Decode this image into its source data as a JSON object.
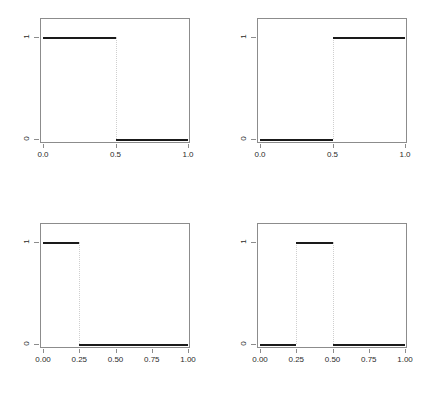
{
  "figure": {
    "layout": "2x2",
    "background_color": "#ffffff",
    "box_color": "#8c8c8c",
    "line_color": "#1a1a1a",
    "dotted_color": "#cfcfcf"
  },
  "chart_data": [
    {
      "type": "line",
      "panel": "top-left",
      "title": "",
      "xlabel": "",
      "ylabel": "",
      "xlim": [
        0.0,
        1.0
      ],
      "ylim": [
        0,
        1
      ],
      "grid": false,
      "legend": null,
      "step_style": "piecewise-constant",
      "xticks": [
        0.0,
        0.5,
        1.0
      ],
      "xtick_labels": [
        "0.0",
        "0.5",
        "1.0"
      ],
      "yticks": [
        0,
        1
      ],
      "ytick_labels": [
        "0",
        "1"
      ],
      "segments": [
        {
          "x_start": 0.0,
          "x_end": 0.5,
          "y": 1
        },
        {
          "x_start": 0.5,
          "x_end": 1.0,
          "y": 0
        }
      ],
      "jumps": [
        0.5
      ]
    },
    {
      "type": "line",
      "panel": "top-right",
      "title": "",
      "xlabel": "",
      "ylabel": "",
      "xlim": [
        0.0,
        1.0
      ],
      "ylim": [
        0,
        1
      ],
      "grid": false,
      "legend": null,
      "step_style": "piecewise-constant",
      "xticks": [
        0.0,
        0.5,
        1.0
      ],
      "xtick_labels": [
        "0.0",
        "0.5",
        "1.0"
      ],
      "yticks": [
        0,
        1
      ],
      "ytick_labels": [
        "0",
        "1"
      ],
      "segments": [
        {
          "x_start": 0.0,
          "x_end": 0.5,
          "y": 0
        },
        {
          "x_start": 0.5,
          "x_end": 1.0,
          "y": 1
        }
      ],
      "jumps": [
        0.5
      ]
    },
    {
      "type": "line",
      "panel": "bottom-left",
      "title": "",
      "xlabel": "",
      "ylabel": "",
      "xlim": [
        0.0,
        1.0
      ],
      "ylim": [
        0,
        1
      ],
      "grid": false,
      "legend": null,
      "step_style": "piecewise-constant",
      "xticks": [
        0.0,
        0.25,
        0.5,
        0.75,
        1.0
      ],
      "xtick_labels": [
        "0.00",
        "0.25",
        "0.50",
        "0.75",
        "1.00"
      ],
      "yticks": [
        0,
        1
      ],
      "ytick_labels": [
        "0",
        "1"
      ],
      "segments": [
        {
          "x_start": 0.0,
          "x_end": 0.25,
          "y": 1
        },
        {
          "x_start": 0.25,
          "x_end": 1.0,
          "y": 0
        }
      ],
      "jumps": [
        0.25
      ]
    },
    {
      "type": "line",
      "panel": "bottom-right",
      "title": "",
      "xlabel": "",
      "ylabel": "",
      "xlim": [
        0.0,
        1.0
      ],
      "ylim": [
        0,
        1
      ],
      "grid": false,
      "legend": null,
      "step_style": "piecewise-constant",
      "xticks": [
        0.0,
        0.25,
        0.5,
        0.75,
        1.0
      ],
      "xtick_labels": [
        "0.00",
        "0.25",
        "0.50",
        "0.75",
        "1.00"
      ],
      "yticks": [
        0,
        1
      ],
      "ytick_labels": [
        "0",
        "1"
      ],
      "segments": [
        {
          "x_start": 0.0,
          "x_end": 0.25,
          "y": 0
        },
        {
          "x_start": 0.25,
          "x_end": 0.5,
          "y": 1
        },
        {
          "x_start": 0.5,
          "x_end": 1.0,
          "y": 0
        }
      ],
      "jumps": [
        0.25,
        0.5
      ]
    }
  ]
}
